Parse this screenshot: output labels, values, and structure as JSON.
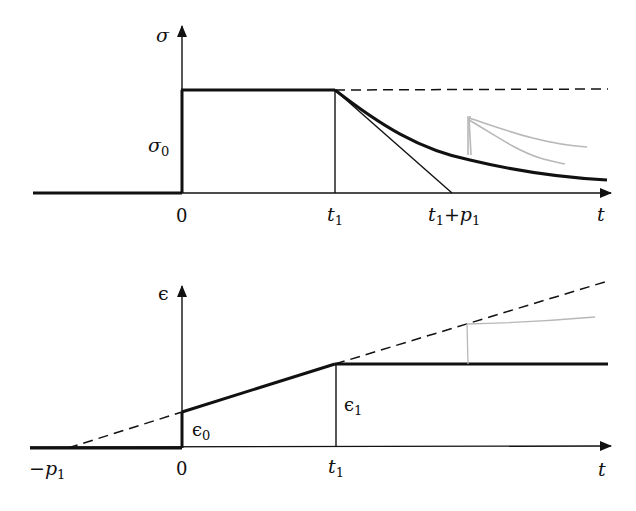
{
  "diagram": {
    "type": "stress-strain time response (relaxation / creep)",
    "colors": {
      "ink": "#111111",
      "annotation": "#b8b8b8",
      "background": "#ffffff"
    }
  },
  "top_plot": {
    "y_axis_label": "σ",
    "level_label": "σ",
    "level_sub": "0",
    "x_axis_label": "t",
    "ticks": {
      "zero": "0",
      "t1_main": "t",
      "t1_sub": "1",
      "t1p1_a": "t",
      "t1p1_a_sub": "1",
      "t1p1_plus": "+",
      "t1p1_b": "p",
      "t1p1_b_sub": "1"
    },
    "curves": [
      {
        "name": "step-stress",
        "style": "thick-solid",
        "desc": "σ=0 for t<0, steps to σ0 at t=0, constant until t1"
      },
      {
        "name": "continued-constant",
        "style": "dashed",
        "desc": "σ0 continued beyond t1"
      },
      {
        "name": "relaxation-curve",
        "style": "thick-solid",
        "desc": "exponential decay from σ0 starting at t1"
      },
      {
        "name": "initial-tangent",
        "style": "thin-solid",
        "desc": "tangent at t1 reaching zero at t1+p1"
      },
      {
        "name": "pencil-annotation",
        "style": "light-gray",
        "desc": "hand-drawn reload step and decay"
      }
    ]
  },
  "bottom_plot": {
    "y_axis_label": "ϵ",
    "x_axis_label": "t",
    "labels": {
      "neg_p1_minus": "−",
      "neg_p1": "p",
      "neg_p1_sub": "1",
      "zero": "0",
      "t1": "t",
      "t1_sub": "1",
      "eps0": "ϵ",
      "eps0_sub": "0",
      "eps1": "ϵ",
      "eps1_sub": "1"
    },
    "curves": [
      {
        "name": "strain-response",
        "style": "thick-solid",
        "desc": "jump to ϵ0 at t=0, linear rise to ϵ1 at t1, then constant"
      },
      {
        "name": "extrapolated-line",
        "style": "dashed",
        "desc": "line through −p1 on axis, continuing beyond t1"
      },
      {
        "name": "pencil-annotation",
        "style": "light-gray",
        "desc": "hand-drawn reload step"
      }
    ]
  }
}
